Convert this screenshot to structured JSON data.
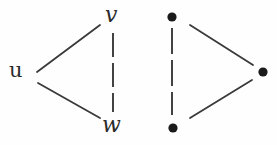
{
  "figure": {
    "background_color": "#fefefe",
    "edge_color": "#3a3a3a",
    "vertex_color": "#1a1a1a",
    "label_color": "#2b2b2b"
  },
  "graphs": [
    {
      "name": "labeled-graph",
      "vertices": [
        {
          "id": "u",
          "label": "u",
          "x": 18,
          "y": 72,
          "style": "label",
          "label_style": "roman"
        },
        {
          "id": "v",
          "label": "v",
          "x": 113,
          "y": 17,
          "style": "label",
          "label_style": "italic"
        },
        {
          "id": "w",
          "label": "w",
          "x": 113,
          "y": 126,
          "style": "label",
          "label_style": "italic"
        }
      ],
      "edges": [
        {
          "from": "u",
          "to": "v",
          "style": "solid",
          "x1": 37,
          "y1": 72,
          "x2": 100,
          "y2": 25
        },
        {
          "from": "u",
          "to": "w",
          "style": "solid",
          "x1": 38,
          "y1": 83,
          "x2": 100,
          "y2": 118
        },
        {
          "from": "v",
          "to": "w",
          "style": "dashed",
          "x1": 113,
          "y1": 33,
          "x2": 113,
          "y2": 112
        }
      ]
    },
    {
      "name": "dot-graph",
      "vertices": [
        {
          "id": "a",
          "label": "",
          "x": 172,
          "y": 17,
          "style": "dot",
          "radius": 4.5
        },
        {
          "id": "b",
          "label": "",
          "x": 173,
          "y": 128,
          "style": "dot",
          "radius": 4.5
        },
        {
          "id": "c",
          "label": "",
          "x": 263,
          "y": 72,
          "style": "dot",
          "radius": 4.5
        }
      ],
      "edges": [
        {
          "from": "a",
          "to": "c",
          "style": "solid",
          "x1": 190,
          "y1": 25,
          "x2": 253,
          "y2": 65
        },
        {
          "from": "b",
          "to": "c",
          "style": "solid",
          "x1": 190,
          "y1": 118,
          "x2": 252,
          "y2": 80
        },
        {
          "from": "a",
          "to": "b",
          "style": "dashed",
          "x1": 172,
          "y1": 28,
          "x2": 172,
          "y2": 115
        }
      ]
    }
  ]
}
